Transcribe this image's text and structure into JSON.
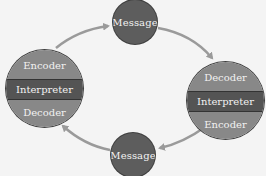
{
  "diagram": {
    "type": "communication-cycle",
    "colors": {
      "background": "#f4f4f4",
      "message_fill": "#5d5d5d",
      "band_light": "#888888",
      "band_dark": "#545454",
      "arrow": "#9a9a9a",
      "text": "#f2f2f2"
    },
    "top_message": {
      "label": "Message"
    },
    "bottom_message": {
      "label": "Message"
    },
    "left_node": {
      "bands": [
        {
          "label": "Encoder"
        },
        {
          "label": "Interpreter"
        },
        {
          "label": "Decoder"
        }
      ]
    },
    "right_node": {
      "bands": [
        {
          "label": "Decoder"
        },
        {
          "label": "Interpreter"
        },
        {
          "label": "Encoder"
        }
      ]
    },
    "arrows": [
      {
        "from": "left_node",
        "to": "top_message"
      },
      {
        "from": "top_message",
        "to": "right_node"
      },
      {
        "from": "right_node",
        "to": "bottom_message"
      },
      {
        "from": "bottom_message",
        "to": "left_node"
      }
    ]
  }
}
